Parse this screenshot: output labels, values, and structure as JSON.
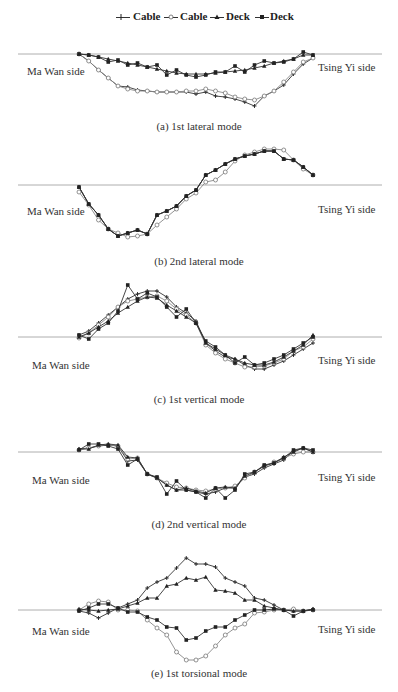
{
  "legend": {
    "items": [
      {
        "label": "Cable",
        "marker": "plus",
        "x": 116
      },
      {
        "label": "Cable",
        "marker": "open-circle",
        "x": 164
      },
      {
        "label": "Deck",
        "marker": "filled-triangle",
        "x": 210
      },
      {
        "label": "Deck",
        "marker": "filled-square",
        "x": 255
      }
    ]
  },
  "labels": {
    "left": "Ma Wan side",
    "right": "Tsing Yi side"
  },
  "chart_data": [
    {
      "type": "line",
      "title": "(a) 1st lateral mode",
      "xlabel": "",
      "ylabel": "",
      "x": [
        0,
        1,
        2,
        3,
        4,
        5,
        6,
        7,
        8,
        9,
        10,
        11,
        12,
        13,
        14,
        15,
        16,
        17,
        18,
        19,
        20,
        21,
        22,
        23,
        24
      ],
      "series": [
        {
          "name": "Cable",
          "marker": "plus",
          "values": [
            0,
            -7,
            -16,
            -24,
            -32,
            -33,
            -36,
            -37,
            -38,
            -38,
            -38,
            -38,
            -40,
            -38,
            -42,
            -43,
            -45,
            -48,
            -52,
            -42,
            -37,
            -31,
            -20,
            -10,
            -4
          ]
        },
        {
          "name": "Cable",
          "marker": "open-circle",
          "values": [
            0,
            -7,
            -16,
            -24,
            -32,
            -35,
            -37,
            -37,
            -38,
            -38,
            -38,
            -37,
            -37,
            -35,
            -37,
            -39,
            -43,
            -45,
            -46,
            -42,
            -37,
            -28,
            -18,
            -8,
            -4
          ]
        },
        {
          "name": "Deck",
          "marker": "filled-triangle",
          "values": [
            0,
            -1,
            -3,
            -5,
            -7,
            -9,
            -11,
            -13,
            -15,
            -17,
            -19,
            -20,
            -20,
            -20,
            -19,
            -18,
            -17,
            -16,
            -14,
            -12,
            -9,
            -7,
            -5,
            -1,
            -1
          ]
        },
        {
          "name": "Deck",
          "marker": "filled-square",
          "values": [
            0,
            -1,
            -3,
            -8,
            -6,
            -11,
            -9,
            -13,
            -11,
            -21,
            -16,
            -21,
            -23,
            -21,
            -18,
            -18,
            -12,
            -18,
            -11,
            -7,
            -9,
            -8,
            -5,
            2,
            -1
          ]
        }
      ]
    },
    {
      "type": "line",
      "title": "(b) 2nd lateral mode",
      "xlabel": "",
      "ylabel": "",
      "x": [
        0,
        1,
        2,
        3,
        4,
        5,
        6,
        7,
        8,
        9,
        10,
        11,
        12,
        13,
        14,
        15,
        16,
        17,
        18,
        19,
        20,
        21,
        22,
        23,
        24
      ],
      "series": [
        {
          "name": "Cable",
          "marker": "plus",
          "values": [
            -2,
            -19,
            -30,
            -44,
            -51,
            -48,
            -45,
            -49,
            -30,
            -26,
            -21,
            -11,
            -5,
            10,
            15,
            21,
            26,
            29,
            31,
            34,
            34,
            26,
            25,
            18,
            10
          ]
        },
        {
          "name": "Cable",
          "marker": "open-circle",
          "values": [
            -7,
            -20,
            -35,
            -44,
            -48,
            -52,
            -51,
            -49,
            -40,
            -32,
            -24,
            -14,
            -8,
            3,
            5,
            13,
            24,
            30,
            33,
            36,
            36,
            35,
            25,
            16,
            10
          ]
        },
        {
          "name": "Deck",
          "marker": "filled-triangle",
          "values": [
            -2,
            -19,
            -30,
            -44,
            -51,
            -48,
            -45,
            -49,
            -30,
            -26,
            -21,
            -11,
            -5,
            10,
            15,
            21,
            26,
            29,
            31,
            34,
            34,
            26,
            25,
            18,
            10
          ]
        },
        {
          "name": "Deck",
          "marker": "filled-square",
          "values": [
            -2,
            -19,
            -30,
            -44,
            -51,
            -48,
            -45,
            -49,
            -30,
            -26,
            -21,
            -11,
            -5,
            10,
            15,
            21,
            26,
            29,
            31,
            34,
            34,
            26,
            25,
            18,
            10
          ]
        }
      ]
    },
    {
      "type": "line",
      "title": "(c) 1st vertical mode",
      "xlabel": "",
      "ylabel": "",
      "x": [
        0,
        1,
        2,
        3,
        4,
        5,
        6,
        7,
        8,
        9,
        10,
        11,
        12,
        13,
        14,
        15,
        16,
        17,
        18,
        19,
        20,
        21,
        22,
        23,
        24
      ],
      "series": [
        {
          "name": "Cable",
          "marker": "plus",
          "values": [
            2,
            6,
            14,
            22,
            30,
            38,
            43,
            46,
            46,
            40,
            30,
            24,
            16,
            -6,
            -14,
            -20,
            -22,
            -28,
            -32,
            -32,
            -28,
            -24,
            -18,
            -12,
            -6
          ]
        },
        {
          "name": "Cable",
          "marker": "open-circle",
          "values": [
            -1,
            4,
            12,
            20,
            30,
            36,
            38,
            40,
            41,
            36,
            28,
            22,
            14,
            -8,
            -16,
            -22,
            -26,
            -30,
            -30,
            -29,
            -26,
            -22,
            -14,
            -10,
            -2
          ]
        },
        {
          "name": "Deck",
          "marker": "filled-triangle",
          "values": [
            0,
            4,
            10,
            16,
            24,
            30,
            36,
            40,
            39,
            32,
            26,
            20,
            14,
            -6,
            -12,
            -18,
            -22,
            -26,
            -28,
            -28,
            -25,
            -20,
            -14,
            -8,
            2
          ]
        },
        {
          "name": "Deck",
          "marker": "filled-square",
          "values": [
            2,
            -2,
            8,
            14,
            26,
            52,
            38,
            44,
            40,
            30,
            20,
            28,
            14,
            -4,
            -10,
            -18,
            -26,
            -20,
            -28,
            -26,
            -22,
            -18,
            -12,
            -6,
            0
          ]
        }
      ]
    },
    {
      "type": "line",
      "title": "(d) 2nd vertical mode",
      "xlabel": "",
      "ylabel": "",
      "x": [
        0,
        1,
        2,
        3,
        4,
        5,
        6,
        7,
        8,
        9,
        10,
        11,
        12,
        13,
        14,
        15,
        16,
        17,
        18,
        19,
        20,
        21,
        22,
        23,
        24
      ],
      "series": [
        {
          "name": "Cable",
          "marker": "plus",
          "values": [
            3,
            4,
            6,
            7,
            6,
            -9,
            -8,
            -22,
            -26,
            -33,
            -38,
            -38,
            -40,
            -42,
            -40,
            -36,
            -36,
            -25,
            -22,
            -16,
            -12,
            -8,
            1,
            4,
            0
          ]
        },
        {
          "name": "Cable",
          "marker": "open-circle",
          "values": [
            2,
            4,
            6,
            7,
            6,
            -7,
            -6,
            -22,
            -26,
            -31,
            -35,
            -36,
            -38,
            -39,
            -37,
            -36,
            -34,
            -26,
            -20,
            -14,
            -10,
            -6,
            -2,
            0,
            0
          ]
        },
        {
          "name": "Deck",
          "marker": "filled-triangle",
          "values": [
            3,
            3,
            7,
            8,
            7,
            -5,
            -6,
            -22,
            -26,
            -33,
            -38,
            -36,
            -39,
            -41,
            -36,
            -35,
            -36,
            -24,
            -20,
            -14,
            -11,
            -5,
            0,
            4,
            0
          ]
        },
        {
          "name": "Deck",
          "marker": "filled-square",
          "values": [
            2,
            8,
            8,
            6,
            3,
            -13,
            -7,
            -22,
            -25,
            -42,
            -29,
            -38,
            -40,
            -46,
            -36,
            -46,
            -38,
            -22,
            -20,
            -13,
            -11,
            -6,
            2,
            4,
            2
          ]
        }
      ]
    },
    {
      "type": "line",
      "title": "(e) 1st torsional mode",
      "xlabel": "",
      "ylabel": "",
      "x": [
        0,
        1,
        2,
        3,
        4,
        5,
        6,
        7,
        8,
        9,
        10,
        11,
        12,
        13,
        14,
        15,
        16,
        17,
        18,
        19,
        20,
        21,
        22,
        23,
        24
      ],
      "series": [
        {
          "name": "Cable",
          "marker": "plus",
          "values": [
            -1,
            -3,
            -8,
            -3,
            2,
            6,
            10,
            22,
            28,
            32,
            42,
            52,
            46,
            46,
            43,
            32,
            28,
            24,
            12,
            10,
            5,
            0,
            -1,
            -1,
            1
          ]
        },
        {
          "name": "Cable",
          "marker": "open-circle",
          "values": [
            0,
            6,
            9,
            8,
            0,
            0,
            -1,
            -10,
            -18,
            -25,
            -42,
            -50,
            -50,
            -46,
            -36,
            -25,
            -18,
            -14,
            -3,
            -2,
            0,
            0,
            1,
            -1,
            0
          ]
        },
        {
          "name": "Deck",
          "marker": "filled-triangle",
          "values": [
            1,
            0,
            -1,
            0,
            1,
            4,
            7,
            12,
            12,
            24,
            26,
            32,
            30,
            33,
            20,
            19,
            17,
            10,
            10,
            4,
            2,
            0,
            -1,
            -1,
            1
          ]
        },
        {
          "name": "Deck",
          "marker": "filled-square",
          "values": [
            -1,
            2,
            6,
            6,
            2,
            -2,
            -2,
            -7,
            -10,
            -17,
            -18,
            -30,
            -28,
            -21,
            -17,
            -17,
            -10,
            -5,
            0,
            0,
            1,
            0,
            -6,
            -1,
            0
          ]
        }
      ]
    }
  ],
  "panels": [
    {
      "caption": "(a) 1st lateral mode"
    },
    {
      "caption": "(b) 2nd lateral mode"
    },
    {
      "caption": "(c) 1st vertical mode"
    },
    {
      "caption": "(d) 2nd vertical mode"
    },
    {
      "caption": "(e) 1st torsional mode"
    }
  ]
}
